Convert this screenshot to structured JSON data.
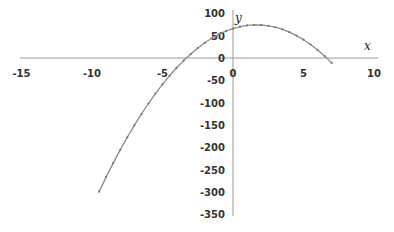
{
  "chart_data": {
    "type": "line",
    "title": "",
    "xlabel": "x",
    "ylabel": "y",
    "xlim": [
      -15,
      10
    ],
    "ylim": [
      -350,
      100
    ],
    "x_ticks": [
      -15,
      -10,
      -5,
      0,
      5,
      10
    ],
    "y_ticks": [
      100,
      50,
      0,
      -50,
      -100,
      -150,
      -200,
      -250,
      -300,
      -350
    ],
    "grid": false,
    "legend": null,
    "series": [
      {
        "name": "y = -3x^2 + 10x + 66",
        "color": "#8c8c8c",
        "x": [
          -9.5,
          -9,
          -8.5,
          -8,
          -7.5,
          -7,
          -6.5,
          -6,
          -5.5,
          -5,
          -4.5,
          -4,
          -3.5,
          -3,
          -2.5,
          -2,
          -1.5,
          -1,
          -0.5,
          0,
          0.5,
          1,
          1.5,
          2,
          2.5,
          3,
          3.5,
          4,
          4.5,
          5,
          5.5,
          6,
          6.5,
          7
        ],
        "values": [
          -299.75,
          -267,
          -235.75,
          -206,
          -177.75,
          -151,
          -125.75,
          -102,
          -79.75,
          -59,
          -39.75,
          -22,
          -5.75,
          9,
          22.25,
          34,
          44.25,
          53,
          60.25,
          66,
          70.25,
          73,
          74.25,
          74,
          72.25,
          69,
          64.25,
          58,
          50.25,
          41,
          30.25,
          18,
          4.25,
          -11
        ]
      }
    ]
  }
}
